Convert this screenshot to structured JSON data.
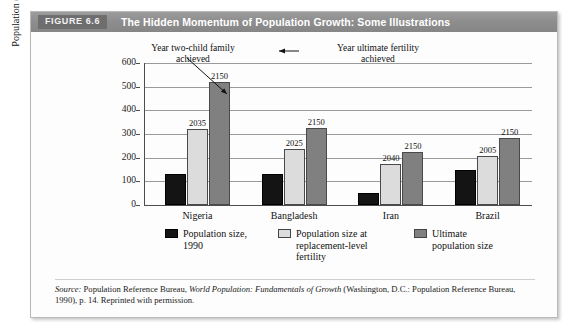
{
  "figure": {
    "chip_label": "FIGURE 6.6",
    "title": "The Hidden Momentum of Population Growth: Some Illustrations"
  },
  "annotations": {
    "left": "Year two-child family\nachieved",
    "left_line1": "Year two-child family",
    "left_line2": "achieved",
    "right_line1": "Year ultimate fertility",
    "right_line2": "achieved"
  },
  "legend": [
    {
      "swatch": "black",
      "line1": "Population size,",
      "line2": "1990",
      "line3": ""
    },
    {
      "swatch": "light-gray",
      "line1": "Population size at",
      "line2": "replacement-level",
      "line3": "fertility"
    },
    {
      "swatch": "dark-gray",
      "line1": "Ultimate",
      "line2": "population size",
      "line3": ""
    }
  ],
  "source": {
    "label": "Source:",
    "text_1": " Population Reference Bureau, ",
    "italic_title": "World Population: Fundamentals of Growth",
    "text_2": " (Washington, D.C.: Population Reference Bureau, 1990), p. 14. Reprinted with permission."
  },
  "colors": {
    "series_1990": "#141414",
    "series_replacement": "#dcdcdc",
    "series_ultimate": "#808080",
    "header_band": "#8e8e8e",
    "header_chip": "#6e6e6e",
    "gridline": "#9a9a9a",
    "axis": "#4d4d4d"
  },
  "chart_data": {
    "type": "bar",
    "title": "The Hidden Momentum of Population Growth: Some Illustrations",
    "xlabel": "",
    "ylabel": "Population (millions)",
    "ylim": [
      0,
      600
    ],
    "yticks": [
      0,
      100,
      200,
      300,
      400,
      500,
      600
    ],
    "ytick_labels": [
      "0",
      "100",
      "200",
      "300",
      "400",
      "500",
      "600"
    ],
    "grid": true,
    "legend_position": "bottom",
    "categories": [
      "Nigeria",
      "Bangladesh",
      "Iran",
      "Brazil"
    ],
    "series": [
      {
        "name": "Population size, 1990",
        "values": [
          130,
          130,
          50,
          150
        ]
      },
      {
        "name": "Population size at replacement-level fertility",
        "values": [
          320,
          235,
          175,
          205
        ]
      },
      {
        "name": "Ultimate population size",
        "values": [
          520,
          325,
          225,
          285
        ]
      }
    ],
    "point_labels": {
      "replacement_year": [
        "2035",
        "2025",
        "2040",
        "2005"
      ],
      "ultimate_year": [
        "2150",
        "2150",
        "2150",
        "2150"
      ]
    }
  }
}
